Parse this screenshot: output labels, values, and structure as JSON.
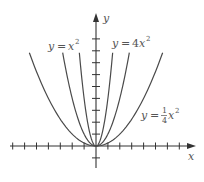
{
  "chart_data": {
    "type": "line",
    "title": "",
    "xlabel": "x",
    "ylabel": "y",
    "xlim": [
      -7,
      8
    ],
    "ylim": [
      -1,
      10
    ],
    "grid": false,
    "tick_spacing": 1,
    "tick_labels": false,
    "series": [
      {
        "name": "y = x^2",
        "label_parts": {
          "lhs": "y",
          "eq": "=",
          "coef": "",
          "var": "x",
          "exp": "2"
        },
        "coefficient": 1,
        "x_range": [
          -2.8,
          2.8
        ]
      },
      {
        "name": "y = 4x^2",
        "label_parts": {
          "lhs": "y",
          "eq": "=",
          "coef": "4",
          "var": "x",
          "exp": "2"
        },
        "coefficient": 4,
        "x_range": [
          -1.4,
          1.4
        ]
      },
      {
        "name": "y = (1/4)x^2",
        "label_parts": {
          "lhs": "y",
          "eq": "=",
          "num": "1",
          "den": "4",
          "var": "x",
          "exp": "2"
        },
        "coefficient": 0.25,
        "x_range": [
          -5.6,
          5.6
        ]
      }
    ],
    "annotations": [
      {
        "text": "y = x²",
        "near": "left-top"
      },
      {
        "text": "y = 4x²",
        "near": "right-top"
      },
      {
        "text": "y = ¼x²",
        "near": "right-middle"
      }
    ]
  },
  "axes": {
    "x_label": "x",
    "y_label": "y"
  },
  "labels": {
    "x2": {
      "lhs": "y",
      "eq": "=",
      "var": "x",
      "exp": "2"
    },
    "x4": {
      "lhs": "y",
      "eq": "=",
      "coef": "4",
      "var": "x",
      "exp": "2"
    },
    "xq": {
      "lhs": "y",
      "eq": "=",
      "num": "1",
      "den": "4",
      "var": "x",
      "exp": "2"
    }
  }
}
